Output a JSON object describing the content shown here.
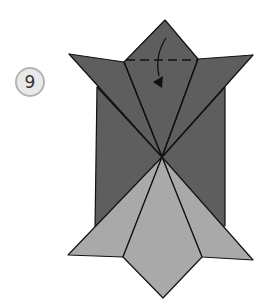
{
  "diagram": {
    "step_number": "9",
    "colors": {
      "dark_paper": "#5e5e5e",
      "light_paper": "#a9a9a9",
      "stroke": "#111111",
      "badge_fill": "#e9e9e9",
      "badge_border": "#b5b5b5"
    },
    "instruction": {
      "fold_line": "dashed",
      "arrow": "fold-down"
    }
  }
}
